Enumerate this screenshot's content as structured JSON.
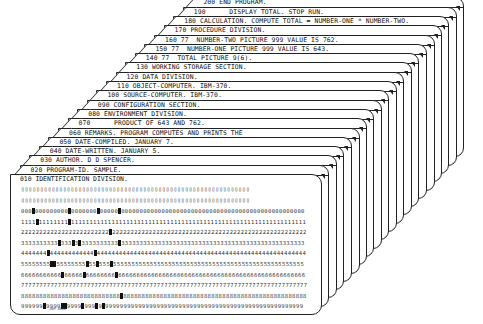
{
  "cards": [
    {
      "seq": "200",
      "text": "200 END PROGRAM."
    },
    {
      "seq": "190",
      "text": "190      DISPLAY TOTAL. STOP RUN."
    },
    {
      "seq": "180",
      "text": "180 CALCULATION. COMPUTE TOTAL = NUMBER-ONE * NUMBER-TWO."
    },
    {
      "seq": "170",
      "text": "170 PROCEDURE DIVISION."
    },
    {
      "seq": "160",
      "text": "160 77  NUMBER-TWO PICTURE 999 VALUE IS 762."
    },
    {
      "seq": "150",
      "text": "150 77  NUMBER-ONE PICTURE 999 VALUE IS 643."
    },
    {
      "seq": "140",
      "text": "140 77  TOTAL PICTURE 9(6)."
    },
    {
      "seq": "130",
      "text": "130 WORKING STORAGE SECTION."
    },
    {
      "seq": "120",
      "text": "120 DATA DIVISION."
    },
    {
      "seq": "110",
      "text": "110 OBJECT-COMPUTER. IBM-370."
    },
    {
      "seq": "100",
      "text": "100 SOURCE-COMPUTER. IBM-370."
    },
    {
      "seq": "090",
      "text": "090 CONFIGURATION SECTION."
    },
    {
      "seq": "080",
      "text": "080 ENVIRONMENT DIVISION."
    },
    {
      "seq": "070",
      "text": "070      PRODUCT OF 643 AND 762."
    },
    {
      "seq": "060",
      "text": "060 REMARKS. PROGRAM COMPUTES AND PRINTS THE"
    },
    {
      "seq": "050",
      "text": "050 DATE-COMPILED. JANUARY 7."
    },
    {
      "seq": "040",
      "text": "040 DATE-WRITTEN. JANUARY 5."
    },
    {
      "seq": "030",
      "text": "030 AUTHOR. D D SPENCER."
    },
    {
      "seq": "020",
      "text": "020 PROGRAM-ID. SAMPLE."
    }
  ],
  "front_card": {
    "text": "010 IDENTIFICATION DIVISION.",
    "zone_row_12": "▯▯▯▯▯▯▯▯▯▯▯▯▯▯▯▯▯▯▯▯▯▯▯▯▯▯▯▯▯▯▯▯▯▯▯▯▯▯▯▯▯▯▯▯▯▯▯▯▯▯▯▯▯▯▯▯▯▯▯▯▯▯▯▯▯▯▯▯▯▯▯▯▯▯▯▯▯▯▯",
    "zone_row_11": "▯▯▯▯▯▯▯▯▯▯▯▯▯▯▯▯▯▯▯▯▯▯▯▯▯▯▯▯▯▯▯▯▯▯▯▯▯▯▯▯▯▯▯▯▯▯▯▯▯▯▯▯▯▯▯▯▯▯▯▯▯▯▯▯▯▯▯▯▯▯▯▯▯▯▯▯▯▯▯",
    "digit_rows": [
      {
        "digit": "0",
        "punched_cols": [
          3,
          13,
          21,
          27
        ]
      },
      {
        "digit": "1",
        "punched_cols": [
          4,
          13
        ]
      },
      {
        "digit": "2",
        "punched_cols": [
          24
        ]
      },
      {
        "digit": "3",
        "punched_cols": [
          10,
          14,
          16,
          27
        ]
      },
      {
        "digit": "4",
        "punched_cols": [
          7,
          20
        ]
      },
      {
        "digit": "5",
        "punched_cols": [
          8,
          9,
          18,
          21,
          25
        ]
      },
      {
        "digit": "6",
        "punched_cols": [
          11,
          17,
          26
        ]
      },
      {
        "digit": "7",
        "punched_cols": []
      },
      {
        "digit": "8",
        "punched_cols": [
          27
        ]
      },
      {
        "digit": "9",
        "punched_cols": [
          6,
          11,
          12,
          17,
          21,
          23
        ]
      }
    ],
    "columns": 80,
    "manufacturer_mark": "IBM 5081"
  }
}
